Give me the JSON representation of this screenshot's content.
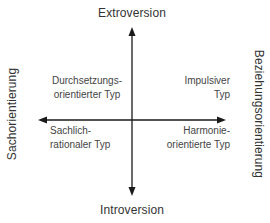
{
  "diagram": {
    "axes": {
      "top": "Extroversion",
      "bottom": "Introversion",
      "left": "Sachorientierung",
      "right": "Beziehungsorientierung"
    },
    "quadrants": {
      "top_left": {
        "line1": "Durchsetzungs-",
        "line2": "orientierter Typ"
      },
      "top_right": {
        "line1": "Impulsiver",
        "line2": "Typ"
      },
      "bottom_left": {
        "line1": "Sachlich-",
        "line2": "rationaler Typ"
      },
      "bottom_right": {
        "line1": "Harmonie-",
        "line2": "orientierte Typ"
      }
    },
    "colors": {
      "axis": "#1a1a1a",
      "text": "#333333",
      "background": "#ffffff"
    }
  }
}
